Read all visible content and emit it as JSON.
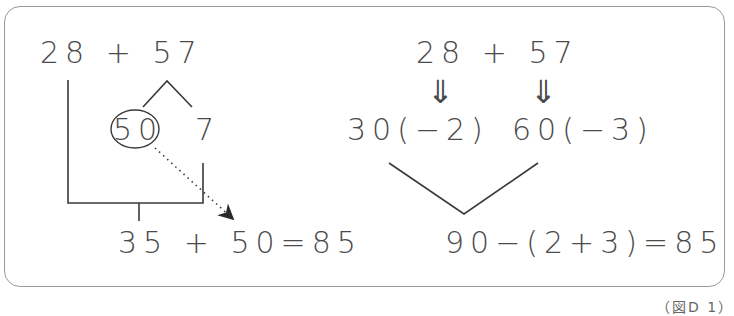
{
  "left_method": {
    "expression": "28 + 57",
    "split_parts": [
      "50",
      "7"
    ],
    "circled": "50",
    "result": "35 + 50=85"
  },
  "right_method": {
    "expression": "28 + 57",
    "arrow_glyph": "⇓",
    "rounded": [
      "30(−2)",
      "60(−3)"
    ],
    "result": "90−(2+3)=85"
  },
  "caption": "（図D 1）",
  "colors": {
    "line": "#3a3a3a",
    "text": "#4a4a4a",
    "frame": "#9a9a9a"
  }
}
